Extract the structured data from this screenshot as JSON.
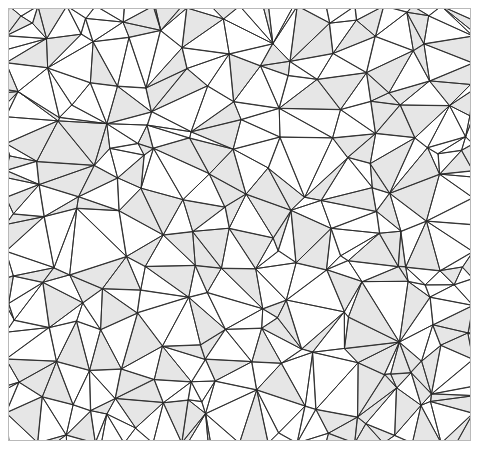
{
  "figure": {
    "name": "random-triangular-mesh",
    "kind": "triangulation-diagram",
    "caption": "",
    "frame": {
      "x": 8,
      "y": 8,
      "width": 463,
      "height": 433,
      "border_color": "#b9b9b9",
      "border_width_px": 1,
      "background": "#ffffff"
    },
    "canvas": {
      "width": 479,
      "height": 456,
      "background": "#ffffff"
    },
    "style": {
      "edge_color": "#2b2b2b",
      "edge_width_px": 0.9,
      "face_fill_shaded": "#e6e6e6",
      "face_fill_plain": "#ffffff",
      "shaded_fraction": 0.42
    },
    "mesh_data": {
      "type": "triangulation",
      "vertex_count": 190,
      "seed": 20240517,
      "description": "Irregular Delaunay-style triangulation of randomly scattered points filling the framed rectangle; a random subset of triangles is filled light gray, the rest white, all edges drawn as thin dark strokes."
    }
  }
}
